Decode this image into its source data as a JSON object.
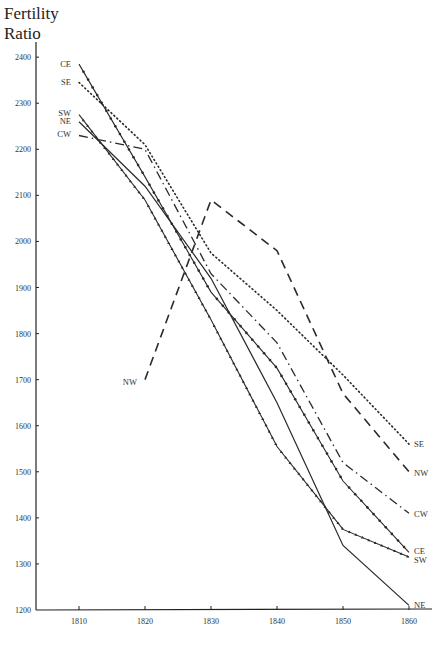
{
  "chart_data": {
    "type": "line",
    "title": "",
    "xlabel": "",
    "ylabel": "Fertility Ratio",
    "ylabel_lines": [
      "Fertility",
      "Ratio"
    ],
    "x": [
      1810,
      1820,
      1830,
      1840,
      1850,
      1860
    ],
    "xticks": [
      1810,
      1820,
      1830,
      1840,
      1850,
      1860
    ],
    "yticks": [
      1200,
      1300,
      1400,
      1500,
      1600,
      1700,
      1800,
      1900,
      2000,
      2100,
      2200,
      2300,
      2400
    ],
    "xlim": [
      1803,
      1864
    ],
    "ylim": [
      1200,
      2420
    ],
    "grid": false,
    "legend": "inline labels at line ends",
    "series": [
      {
        "name": "CE",
        "style": "solid-with-dots",
        "values": [
          2385,
          2140,
          1890,
          1725,
          1480,
          1325
        ]
      },
      {
        "name": "SE",
        "style": "dotted",
        "values": [
          2345,
          2210,
          1975,
          1850,
          1710,
          1560
        ]
      },
      {
        "name": "SW",
        "style": "solid-with-triangles",
        "values": [
          2275,
          2090,
          1830,
          1555,
          1375,
          1315
        ]
      },
      {
        "name": "NE",
        "style": "solid",
        "values": [
          2260,
          2120,
          1920,
          1650,
          1340,
          1210
        ]
      },
      {
        "name": "CW",
        "style": "dash-dot",
        "values": [
          2230,
          2200,
          1930,
          1780,
          1520,
          1410
        ]
      },
      {
        "name": "NW",
        "style": "dashed",
        "values": [
          null,
          1700,
          2090,
          1980,
          1670,
          1500
        ]
      }
    ]
  }
}
